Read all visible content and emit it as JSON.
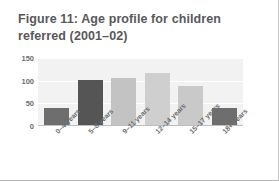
{
  "figure": {
    "title": "Figure 11: Age profile for children referred (2001–02)"
  },
  "chart_data": {
    "type": "bar",
    "title": "Figure 11: Age profile for children referred (2001–02)",
    "xlabel": "",
    "ylabel": "",
    "categories": [
      "0–4 years",
      "5–8 years",
      "9–11 years",
      "12–14 years",
      "15–17 years",
      "18+ years"
    ],
    "values": [
      40,
      102,
      105,
      118,
      88,
      40
    ],
    "ylim": [
      0,
      150
    ],
    "yticks": [
      0,
      50,
      100,
      150
    ],
    "ytick_labels": [
      "0",
      "50",
      "100",
      "150"
    ],
    "grid": true,
    "legend": false,
    "bar_colors": [
      "#6e6e6e",
      "#555555",
      "#c3c3c3",
      "#cfcfcf",
      "#c9c9c9",
      "#6e6e6e"
    ],
    "plot_background": "#f2f2f2",
    "gridline_color": "#ffffff",
    "axis_color": "#bfbfbf",
    "title_color": "#58595b",
    "tick_label_color": "#6d6e71"
  }
}
